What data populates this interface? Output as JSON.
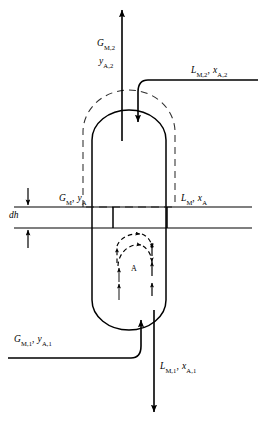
{
  "figure": {
    "type": "process-flow-diagram"
  },
  "streams": {
    "gas_out": {
      "name": "gas-outlet-top",
      "symbol_flow": "G",
      "symbol_flow_sub": "M,2",
      "symbol_comp": "y",
      "symbol_comp_sub": "A,2",
      "label_line1": "G",
      "label_line1_sub": "M,2",
      "label_line2": "y",
      "label_line2_sub": "A,2"
    },
    "liquid_in": {
      "name": "liquid-inlet-top",
      "label_flow": "L",
      "label_flow_sub": "M,2",
      "separator": ",",
      "label_comp": "x",
      "label_comp_sub": "A,2"
    },
    "gas_in": {
      "name": "gas-inlet-bottom",
      "label_flow": "G",
      "label_flow_sub": "M,1",
      "separator": ",",
      "label_comp": "y",
      "label_comp_sub": "A,1"
    },
    "liquid_out": {
      "name": "liquid-outlet-bottom",
      "label_flow": "L",
      "label_flow_sub": "M,1",
      "separator": ",",
      "label_comp": "x",
      "label_comp_sub": "A,1"
    }
  },
  "element": {
    "height_label": "dh",
    "gas_side": {
      "label_flow": "G",
      "label_flow_sub": "M",
      "separator": ",",
      "label_comp": "y",
      "label_comp_sub": "A"
    },
    "liquid_side": {
      "label_flow": "L",
      "label_flow_sub": "M",
      "separator": ",",
      "label_comp": "x",
      "label_comp_sub": "A"
    }
  },
  "transfer": {
    "species_label": "A",
    "species_label_upper": "A"
  },
  "colors": {
    "line": "#000000",
    "dashed": "#3a3a3a",
    "background": "#ffffff"
  }
}
